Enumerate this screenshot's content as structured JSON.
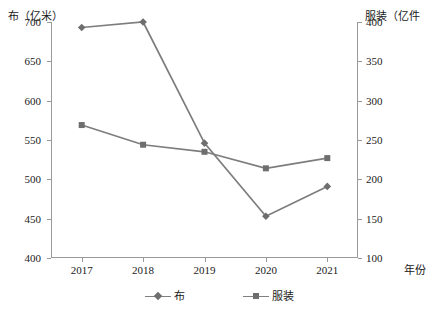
{
  "chart_data": {
    "type": "line",
    "title": "",
    "xlabel": "年份",
    "categories": [
      "2017",
      "2018",
      "2019",
      "2020",
      "2021"
    ],
    "grid": false,
    "legend_position": "bottom",
    "axes": {
      "left": {
        "label": "布（亿米）",
        "unit": "亿米",
        "min": 400,
        "max": 700,
        "step": 50,
        "ticks": [
          "700",
          "650",
          "600",
          "550",
          "500",
          "450",
          "400"
        ],
        "tick_values": [
          700,
          650,
          600,
          550,
          500,
          450,
          400
        ]
      },
      "right": {
        "label": "服装（亿件",
        "unit": "亿件",
        "min": 100,
        "max": 400,
        "step": 50,
        "ticks": [
          "400",
          "350",
          "300",
          "250",
          "200",
          "150",
          "100"
        ],
        "tick_values": [
          400,
          350,
          300,
          250,
          200,
          150,
          100
        ]
      },
      "x": {
        "label": "年份",
        "ticks": [
          "2017",
          "2018",
          "2019",
          "2020",
          "2021"
        ]
      }
    },
    "series": [
      {
        "name": "布",
        "axis": "left",
        "marker": "diamond",
        "color": "#7d7d7d",
        "values": [
          693,
          700,
          546,
          453,
          491
        ]
      },
      {
        "name": "服装",
        "axis": "right",
        "marker": "square",
        "color": "#7d7d7d",
        "values": [
          269,
          244,
          235,
          214,
          227
        ]
      }
    ]
  },
  "legend": {
    "items": [
      {
        "label": "布",
        "marker": "diamond"
      },
      {
        "label": "服装",
        "marker": "square"
      }
    ]
  },
  "colors": {
    "series": "#7d7d7d",
    "axis": "#9a9a9a",
    "text": "#1a1a1a",
    "background": "#ffffff"
  }
}
